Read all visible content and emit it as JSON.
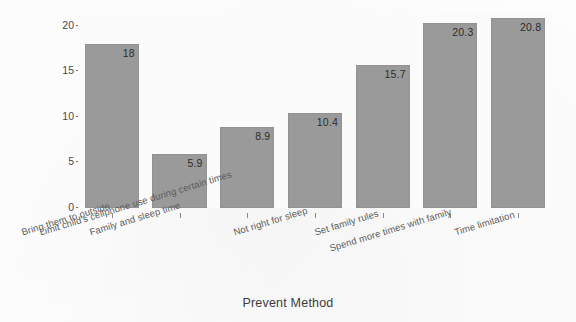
{
  "chart_data": {
    "type": "bar",
    "title": "",
    "xlabel": "Prevent Method",
    "ylabel": "Percent",
    "categories": [
      "Bring them to outside",
      "Family and sleep time",
      "Limit child's cellphone use during certain times",
      "Not right for sleep",
      "Set family rules",
      "Spend more times with family",
      "Time limitation"
    ],
    "values": [
      18,
      5.9,
      8.9,
      10.4,
      15.7,
      20.3,
      20.8
    ],
    "value_labels": [
      "18",
      "5.9",
      "8.9",
      "10.4",
      "15.7",
      "20.3",
      "20.8"
    ],
    "ylim": [
      0,
      21.5
    ],
    "yticks": [
      0,
      5,
      10,
      15,
      20
    ],
    "ytick_labels": [
      "0",
      "5",
      "10",
      "15",
      "20"
    ],
    "grid": false,
    "legend": null,
    "bar_color": "#9a9a9a",
    "plot_background": "#fbfbfb",
    "text_color": "#3b3b3b"
  }
}
